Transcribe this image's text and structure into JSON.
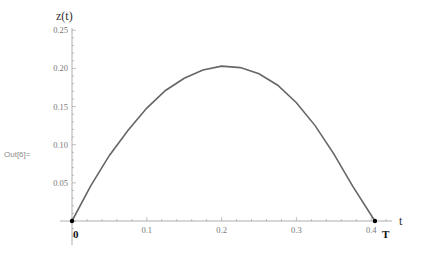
{
  "cell": {
    "out_label": "Out[6]="
  },
  "chart_data": {
    "type": "line",
    "title": "",
    "xlabel": "t",
    "ylabel": "z(t)",
    "xlim": [
      -0.005,
      0.44
    ],
    "ylim": [
      0,
      0.25
    ],
    "x_ticks": [
      "0.1",
      "0.2",
      "0.3",
      "0.4"
    ],
    "y_ticks": [
      "0.05",
      "0.10",
      "0.15",
      "0.20",
      "0.25"
    ],
    "grid": false,
    "series": [
      {
        "name": "z(t)",
        "color": "#666666",
        "x": [
          0,
          0.025,
          0.05,
          0.075,
          0.1,
          0.125,
          0.15,
          0.175,
          0.2,
          0.225,
          0.25,
          0.275,
          0.3,
          0.325,
          0.35,
          0.375,
          0.405
        ],
        "y": [
          0,
          0.046,
          0.086,
          0.119,
          0.148,
          0.171,
          0.187,
          0.198,
          0.203,
          0.201,
          0.193,
          0.178,
          0.155,
          0.125,
          0.088,
          0.046,
          0
        ]
      }
    ],
    "annotations": [
      {
        "label": "0",
        "x": 0,
        "y": 0,
        "marker": "point"
      },
      {
        "label": "T",
        "x": 0.405,
        "y": 0,
        "marker": "point"
      }
    ]
  }
}
